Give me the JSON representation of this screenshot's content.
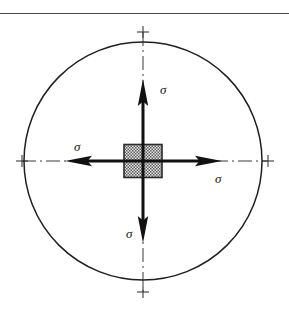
{
  "figure": {
    "kind": "engineering-stress-diagram",
    "background_color": "#ffffff",
    "line_color": "#1a1a1a",
    "arrow_color": "#111111",
    "hatch_color": "#555555",
    "square_fill_color": "#cfcfcf",
    "top_rule": {
      "visible": true,
      "y": 13,
      "x_start": 0,
      "x_end": 289,
      "color": "#4a4a4a"
    },
    "circle": {
      "center_x": 143,
      "center_y": 161,
      "radius": 119,
      "stroke_width": 1.5,
      "fill": "none"
    },
    "center_square": {
      "center_x": 143,
      "center_y": 161,
      "width": 38,
      "height": 33,
      "fill_pattern": "checkered-stipple",
      "stroke_width": 1.6
    },
    "centerlines": {
      "style": "dash-dot",
      "stroke_width": 1,
      "horizontal": {
        "x_start": 22,
        "x_end": 268,
        "y": 161
      },
      "vertical": {
        "y_start": 32,
        "y_end": 292,
        "x": 143
      },
      "end_ticks": [
        {
          "name": "left-tick",
          "x": 22,
          "y": 161
        },
        {
          "name": "right-tick",
          "x": 268,
          "y": 161
        },
        {
          "name": "top-tick",
          "x": 143,
          "y": 32
        },
        {
          "name": "bottom-tick",
          "x": 143,
          "y": 292
        }
      ],
      "tick_size": 11
    },
    "arrows": [
      {
        "name": "stress-arrow-up",
        "direction": "up",
        "tail_x": 143,
        "tail_y": 161,
        "tip_x": 143,
        "tip_y": 80,
        "shaft_width": 3,
        "head_length": 26,
        "head_width": 11,
        "label": "σ",
        "label_position": "right-of-tip"
      },
      {
        "name": "stress-arrow-down",
        "direction": "down",
        "tail_x": 143,
        "tail_y": 161,
        "tip_x": 143,
        "tip_y": 243,
        "shaft_width": 3,
        "head_length": 26,
        "head_width": 11,
        "label": "σ",
        "label_position": "left-of-tip"
      },
      {
        "name": "stress-arrow-left",
        "direction": "left",
        "tail_x": 143,
        "tail_y": 161,
        "tip_x": 66,
        "tip_y": 161,
        "shaft_width": 3,
        "head_length": 26,
        "head_width": 11,
        "label": "σ",
        "label_position": "above-tip"
      },
      {
        "name": "stress-arrow-right",
        "direction": "right",
        "tail_x": 143,
        "tail_y": 161,
        "tip_x": 222,
        "tip_y": 161,
        "shaft_width": 3,
        "head_length": 26,
        "head_width": 11,
        "label": "σ",
        "label_position": "below-tip"
      }
    ],
    "labels": {
      "sigma_top": "σ",
      "sigma_bottom": "σ",
      "sigma_left": "σ",
      "sigma_right": "σ"
    }
  }
}
